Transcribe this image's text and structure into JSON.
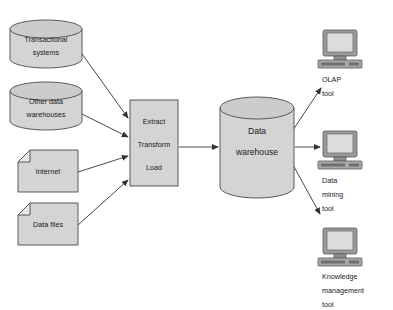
{
  "diagram": {
    "colors": {
      "shape_fill": "#d4d4d4",
      "shape_stroke": "#4a4a4a",
      "connector": "#333333",
      "monitor_bezel": "#9a9a9a",
      "monitor_screen": "#dcdcdc",
      "background": "#ffffff",
      "text": "#1a1a1a"
    },
    "sources": [
      {
        "id": "transactional-systems",
        "shape": "cylinder",
        "lines": [
          "Transactional",
          "systems"
        ]
      },
      {
        "id": "other-data-warehouses",
        "shape": "cylinder",
        "lines": [
          "Other data",
          "warehouses"
        ]
      },
      {
        "id": "internet",
        "shape": "document",
        "lines": [
          "Internet"
        ]
      },
      {
        "id": "data-files",
        "shape": "document",
        "lines": [
          "Data files"
        ]
      }
    ],
    "process": {
      "id": "etl-process",
      "shape": "rectangle",
      "lines": [
        "Extract",
        "Transform",
        "Load"
      ]
    },
    "warehouse": {
      "id": "data-warehouse",
      "shape": "cylinder",
      "lines": [
        "Data",
        "warehouse"
      ]
    },
    "tools": [
      {
        "id": "olap-tool",
        "icon": "computer-icon",
        "lines": [
          "OLAP",
          "tool"
        ]
      },
      {
        "id": "data-mining-tool",
        "icon": "computer-icon",
        "lines": [
          "Data",
          "mining",
          "tool"
        ]
      },
      {
        "id": "knowledge-management-tool",
        "icon": "computer-icon",
        "lines": [
          "Knowledge",
          "management",
          "tool"
        ]
      }
    ]
  }
}
